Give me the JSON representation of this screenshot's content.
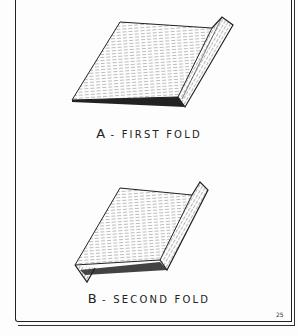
{
  "figures": [
    {
      "letter": "A",
      "separator": "-",
      "caption": "FIRST FOLD"
    },
    {
      "letter": "B",
      "separator": "-",
      "caption": "SECOND FOLD"
    }
  ],
  "page_number": "25",
  "colors": {
    "ink": "#222222",
    "paper": "#fdfdfd"
  }
}
